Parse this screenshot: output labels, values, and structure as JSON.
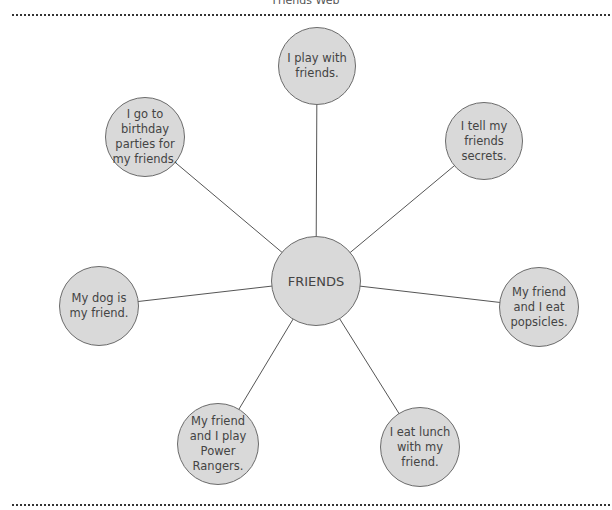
{
  "title": "Friends Web",
  "center": {
    "label": "FRIENDS",
    "cx": 316,
    "cy": 281,
    "r": 45
  },
  "nodes": [
    {
      "label": "I play with friends.",
      "cx": 317,
      "cy": 66,
      "r": 39
    },
    {
      "label": "I go to birthday parties for my friends.",
      "cx": 145,
      "cy": 137,
      "r": 40
    },
    {
      "label": "I tell my friends secrets.",
      "cx": 484,
      "cy": 141,
      "r": 39
    },
    {
      "label": "My dog is my friend.",
      "cx": 99,
      "cy": 306,
      "r": 40
    },
    {
      "label": "My friend and I eat popsicles.",
      "cx": 539,
      "cy": 307,
      "r": 40
    },
    {
      "label": "My friend and I play Power Rangers.",
      "cx": 218,
      "cy": 444,
      "r": 41
    },
    {
      "label": "I eat lunch with my friend.",
      "cx": 420,
      "cy": 447,
      "r": 40
    }
  ],
  "colors": {
    "node_fill": "#d9d9d9",
    "node_stroke": "#6b6b6b",
    "line": "#555555",
    "text": "#444444"
  }
}
